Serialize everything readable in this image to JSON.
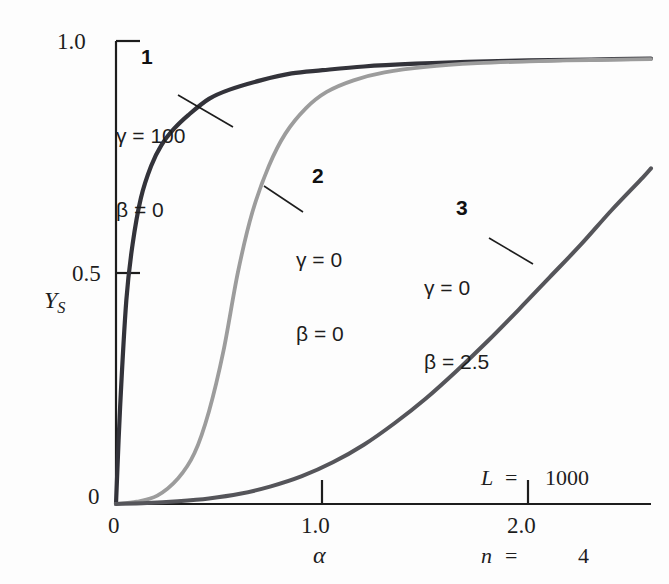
{
  "figure": {
    "background_color": "#fdfdfd",
    "axis_color": "#1d1d1d"
  },
  "axes": {
    "x": {
      "label": "α",
      "ticks": [
        {
          "value": 0,
          "text": "0"
        },
        {
          "value": 1.0,
          "text": "1.0"
        },
        {
          "value": 2.0,
          "text": "2.0"
        }
      ],
      "range": [
        0,
        2.59
      ]
    },
    "y": {
      "label_main": "Y",
      "label_sub": "S",
      "ticks": [
        {
          "value": 0,
          "text": "0"
        },
        {
          "value": 0.5,
          "text": "0.5"
        },
        {
          "value": 1.0,
          "text": "1.0"
        }
      ],
      "range": [
        0,
        1.0
      ]
    }
  },
  "conditions": {
    "line1": {
      "symbol": "L",
      "equals": "=",
      "value": "1000"
    },
    "line2": {
      "symbol": "n",
      "equals": "=",
      "value": "4"
    }
  },
  "annotations": [
    {
      "number": "1",
      "gamma": "γ = 100",
      "beta": "β = 0",
      "color": "#33333a"
    },
    {
      "number": "2",
      "gamma": "γ = 0",
      "beta": "β = 0",
      "color": "#9c9c9c"
    },
    {
      "number": "3",
      "gamma": "γ = 0",
      "beta": "β = 2.5",
      "color": "#55555a"
    }
  ],
  "chart_data": {
    "type": "line",
    "title": "",
    "xlabel": "α",
    "ylabel": "Y_S",
    "xlim": [
      0,
      2.59
    ],
    "ylim": [
      0,
      1.0
    ],
    "grid": false,
    "legend": "inline-annotations",
    "conditions": {
      "L": 1000,
      "n": 4
    },
    "series": [
      {
        "name": "1",
        "gamma": 100,
        "beta": 0,
        "color": "#33333a",
        "x": [
          0,
          0.02,
          0.05,
          0.08,
          0.12,
          0.17,
          0.22,
          0.28,
          0.35,
          0.45,
          0.55,
          0.7,
          0.85,
          1.0,
          1.2,
          1.45,
          1.7,
          2.0,
          2.3,
          2.59
        ],
        "y": [
          0,
          0.21,
          0.44,
          0.56,
          0.66,
          0.73,
          0.775,
          0.81,
          0.84,
          0.875,
          0.895,
          0.915,
          0.93,
          0.937,
          0.945,
          0.951,
          0.955,
          0.958,
          0.96,
          0.962
        ]
      },
      {
        "name": "2",
        "gamma": 0,
        "beta": 0,
        "color": "#9c9c9c",
        "x": [
          0,
          0.1,
          0.2,
          0.3,
          0.38,
          0.45,
          0.52,
          0.59,
          0.66,
          0.74,
          0.82,
          0.92,
          1.02,
          1.15,
          1.3,
          1.5,
          1.75,
          2.0,
          2.3,
          2.59
        ],
        "y": [
          0,
          0.005,
          0.018,
          0.055,
          0.11,
          0.2,
          0.33,
          0.5,
          0.63,
          0.73,
          0.8,
          0.855,
          0.89,
          0.915,
          0.932,
          0.944,
          0.952,
          0.956,
          0.959,
          0.961
        ]
      },
      {
        "name": "3",
        "gamma": 0,
        "beta": 2.5,
        "color": "#55555a",
        "x": [
          0,
          0.15,
          0.3,
          0.45,
          0.6,
          0.75,
          0.9,
          1.05,
          1.2,
          1.35,
          1.5,
          1.65,
          1.8,
          1.95,
          2.1,
          2.25,
          2.4,
          2.55,
          2.59
        ],
        "y": [
          0,
          0.002,
          0.006,
          0.012,
          0.022,
          0.038,
          0.06,
          0.09,
          0.128,
          0.175,
          0.228,
          0.288,
          0.352,
          0.42,
          0.49,
          0.56,
          0.635,
          0.705,
          0.725
        ]
      }
    ]
  }
}
